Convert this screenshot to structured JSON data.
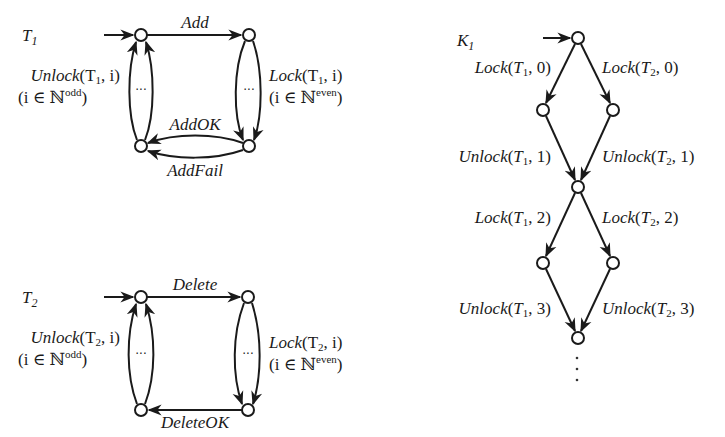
{
  "automata": {
    "T1": {
      "name": "T",
      "sub": "1",
      "edges": {
        "top": "Add",
        "bottom_upper": "AddOK",
        "bottom_lower": "AddFail",
        "left_fn": "Unlock",
        "left_args_pre": "(T",
        "left_args_sub": "1",
        "left_args_post": ", i)",
        "left_cond_pre": "(i ∈ ℕ",
        "left_cond_sup": "odd",
        "left_cond_post": ")",
        "right_fn": "Lock",
        "right_args_pre": "(T",
        "right_args_sub": "1",
        "right_args_post": ", i)",
        "right_cond_pre": "(i ∈ ℕ",
        "right_cond_sup": "even",
        "right_cond_post": ")"
      },
      "loop_ellipsis": "···"
    },
    "T2": {
      "name": "T",
      "sub": "2",
      "edges": {
        "top": "Delete",
        "bottom": "DeleteOK",
        "left_fn": "Unlock",
        "left_args_pre": "(T",
        "left_args_sub": "2",
        "left_args_post": ", i)",
        "left_cond_pre": "(i ∈ ℕ",
        "left_cond_sup": "odd",
        "left_cond_post": ")",
        "right_fn": "Lock",
        "right_args_pre": "(T",
        "right_args_sub": "2",
        "right_args_post": ", i)",
        "right_cond_pre": "(i ∈ ℕ",
        "right_cond_sup": "even",
        "right_cond_post": ")"
      },
      "loop_ellipsis": "···"
    },
    "K1": {
      "name": "K",
      "sub": "1",
      "transitions": [
        {
          "fn": "Lock",
          "t": "1",
          "n": "0"
        },
        {
          "fn": "Lock",
          "t": "2",
          "n": "0"
        },
        {
          "fn": "Unlock",
          "t": "1",
          "n": "1"
        },
        {
          "fn": "Unlock",
          "t": "2",
          "n": "1"
        },
        {
          "fn": "Lock",
          "t": "1",
          "n": "2"
        },
        {
          "fn": "Lock",
          "t": "2",
          "n": "2"
        },
        {
          "fn": "Unlock",
          "t": "1",
          "n": "3"
        },
        {
          "fn": "Unlock",
          "t": "2",
          "n": "3"
        }
      ],
      "continuation": "⋮"
    }
  },
  "colors": {
    "stroke": "#1a1a1a",
    "background": "#ffffff"
  }
}
